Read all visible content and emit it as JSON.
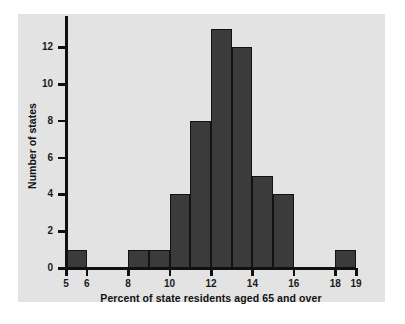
{
  "chart_data": {
    "type": "bar",
    "title": "",
    "xlabel": "Percent of state residents aged 65 and over",
    "ylabel": "Number of states",
    "xlim": [
      5,
      19
    ],
    "ylim": [
      0,
      13.6
    ],
    "grid": false,
    "legend": null,
    "bin_width": 1,
    "bin_edges": [
      5,
      6,
      7,
      8,
      9,
      10,
      11,
      12,
      13,
      14,
      15,
      16,
      17,
      18,
      19
    ],
    "categories": [
      "5-6",
      "6-7",
      "7-8",
      "8-9",
      "9-10",
      "10-11",
      "11-12",
      "12-13",
      "13-14",
      "14-15",
      "15-16",
      "16-17",
      "17-18",
      "18-19"
    ],
    "values": [
      1,
      0,
      0,
      1,
      1,
      4,
      8,
      13,
      12,
      5,
      4,
      0,
      0,
      1
    ],
    "xticks": [
      5,
      6,
      8,
      10,
      12,
      14,
      16,
      18,
      19
    ],
    "xticklabels": [
      "5",
      "6",
      "8",
      "10",
      "12",
      "14",
      "16",
      "18",
      "19"
    ],
    "yticks": [
      0,
      2,
      4,
      6,
      8,
      10,
      12
    ],
    "yticklabels": [
      "0",
      "2",
      "4",
      "6",
      "8",
      "10",
      "12"
    ],
    "bar_color": "#3b3b3b",
    "bar_edge_color": "#121212",
    "panel_color": "#e3e3e3",
    "axis_color": "#101010"
  }
}
